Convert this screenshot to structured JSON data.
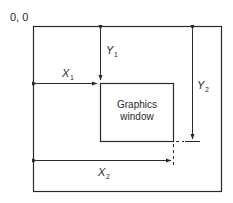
{
  "diagram": {
    "origin_label": "0, 0",
    "inner_window_label": [
      "Graphics",
      "window"
    ],
    "dimensions": [
      {
        "id": "x1",
        "symbol": "X",
        "subscript": "1",
        "description": "horizontal offset from left edge to graphics window left edge"
      },
      {
        "id": "y1",
        "symbol": "Y",
        "subscript": "1",
        "description": "vertical offset from top edge to graphics window top edge"
      },
      {
        "id": "x2",
        "symbol": "X",
        "subscript": "2",
        "description": "horizontal offset from left edge to graphics window right edge"
      },
      {
        "id": "y2",
        "symbol": "Y",
        "subscript": "2",
        "description": "vertical offset from top edge to graphics window bottom edge"
      }
    ],
    "colors": {
      "line": "#2a2a2a",
      "background": "#ffffff"
    }
  }
}
